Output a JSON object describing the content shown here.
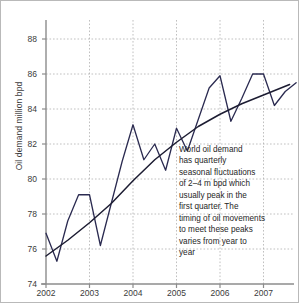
{
  "chart_data": {
    "type": "line",
    "title": "",
    "xlabel": "",
    "ylabel": "Oil demand million bpd",
    "ylim": [
      74,
      88
    ],
    "yticks": [
      74,
      76,
      78,
      80,
      82,
      84,
      86,
      88
    ],
    "xlim": [
      2002,
      2007.75
    ],
    "xticks": [
      2002,
      2003,
      2004,
      2005,
      2006,
      2007
    ],
    "xtick_labels": [
      "2002",
      "2003",
      "2004",
      "2005",
      "2006",
      "2007"
    ],
    "grid": true,
    "legend": "none",
    "series": [
      {
        "name": "Quarterly world oil demand",
        "kind": "zigzag",
        "color": "#2a2a50",
        "x": [
          2002.0,
          2002.25,
          2002.5,
          2002.75,
          2003.0,
          2003.25,
          2003.5,
          2003.75,
          2004.0,
          2004.25,
          2004.5,
          2004.75,
          2005.0,
          2005.25,
          2005.5,
          2005.75,
          2006.0,
          2006.25,
          2006.5,
          2006.75,
          2007.0,
          2007.25,
          2007.5,
          2007.75
        ],
        "values": [
          76.9,
          75.3,
          77.6,
          79.1,
          79.1,
          76.2,
          78.6,
          81.0,
          83.1,
          81.1,
          82.0,
          80.5,
          82.9,
          81.6,
          83.4,
          85.2,
          85.9,
          83.3,
          84.6,
          86.0,
          86.0,
          84.2,
          85.0,
          85.5
        ]
      },
      {
        "name": "Trend",
        "kind": "smooth-trend",
        "color": "#1c1c32",
        "x": [
          2002.0,
          2002.5,
          2003.0,
          2003.5,
          2004.0,
          2004.5,
          2005.0,
          2005.5,
          2006.0,
          2006.5,
          2007.0,
          2007.6
        ],
        "values": [
          75.6,
          76.5,
          77.5,
          78.6,
          79.9,
          81.1,
          82.1,
          83.0,
          83.7,
          84.3,
          84.8,
          85.4
        ]
      }
    ],
    "annotation": {
      "lines": [
        "World oil demand",
        "has quarterly",
        "seasonal fluctuations",
        "of 2–4 m bpd which",
        "usually peak in the",
        "first quarter. The",
        "timing of oil movements",
        "to meet these peaks",
        "varies from year to",
        "year"
      ]
    },
    "colors": {
      "series": "#2a2a50",
      "trend": "#1c1c32",
      "grid": "#b0b0b0",
      "axis": "#8c8c8c",
      "text": "#3b3b3b",
      "border": "#b9b9b9"
    }
  }
}
